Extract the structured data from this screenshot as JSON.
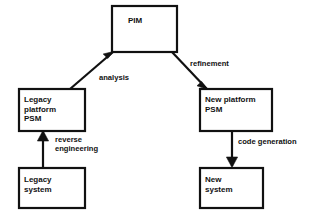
{
  "diagram": {
    "background_color": "#ffffff",
    "line_color": "#111111",
    "nodes": [
      {
        "id": "pim",
        "label": "PIM",
        "x": 112,
        "y": 6,
        "width": 65,
        "height": 46,
        "text_x": 128,
        "text_y": 16
      },
      {
        "id": "legacy-platform-psm",
        "label": "Legacy\nplatform\nPSM",
        "x": 19,
        "y": 89,
        "width": 66,
        "height": 42,
        "text_x": 24,
        "text_y": 95
      },
      {
        "id": "legacy-system",
        "label": "Legacy\nsystem",
        "x": 19,
        "y": 168,
        "width": 66,
        "height": 40,
        "text_x": 24,
        "text_y": 175
      },
      {
        "id": "new-platform-psm",
        "label": "New platform\nPSM",
        "x": 200,
        "y": 89,
        "width": 72,
        "height": 42,
        "text_x": 205,
        "text_y": 95
      },
      {
        "id": "new-system",
        "label": "New\nsystem",
        "x": 200,
        "y": 168,
        "width": 63,
        "height": 40,
        "text_x": 205,
        "text_y": 175
      }
    ],
    "edges": [
      {
        "id": "analysis",
        "label": "analysis",
        "from": "legacy-platform-psm",
        "to": "pim",
        "label_x": 99,
        "label_y": 73
      },
      {
        "id": "refinement",
        "label": "refinement",
        "from": "pim",
        "to": "new-platform-psm",
        "label_x": 190,
        "label_y": 59
      },
      {
        "id": "reverse-engineering",
        "label": "reverse\nengineering",
        "from": "legacy-system",
        "to": "legacy-platform-psm",
        "label_x": 55,
        "label_y": 135
      },
      {
        "id": "code-generation",
        "label": "code generation",
        "from": "new-platform-psm",
        "to": "new-system",
        "label_x": 238,
        "label_y": 137
      }
    ]
  }
}
